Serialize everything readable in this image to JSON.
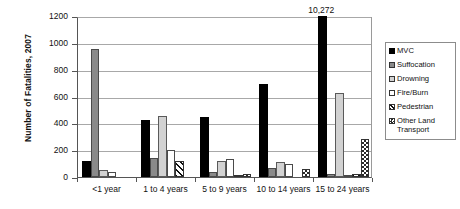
{
  "chart_data": {
    "type": "bar",
    "title": "",
    "xlabel": "",
    "ylabel": "Number of Fatalities, 2007",
    "ylim": [
      0,
      1200
    ],
    "ytick_labels": [
      "0",
      "200",
      "400",
      "600",
      "800",
      "1000",
      "1200"
    ],
    "ytick_values": [
      0,
      200,
      400,
      600,
      800,
      1000,
      1200
    ],
    "grid": true,
    "legend_position": "right",
    "categories": [
      "<1 year",
      "1 to 4 years",
      "5 to 9 years",
      "10 to 14 years",
      "15 to 24 years"
    ],
    "series": [
      {
        "name": "MVC",
        "values": [
          120,
          425,
          450,
          690,
          10272
        ]
      },
      {
        "name": "Suffocation",
        "values": [
          955,
          145,
          40,
          70,
          20
        ]
      },
      {
        "name": "Drowning",
        "values": [
          55,
          455,
          120,
          115,
          625
        ]
      },
      {
        "name": "Fire/Burn",
        "values": [
          35,
          205,
          135,
          95,
          10
        ]
      },
      {
        "name": "Pedestrian",
        "values": [
          0,
          120,
          15,
          0,
          25
        ]
      },
      {
        "name": "Other Land Transport",
        "values": [
          0,
          0,
          20,
          60,
          280
        ]
      }
    ],
    "annotations": [
      {
        "text": "10,272",
        "series": "MVC",
        "category": "15 to 24 years",
        "note": "value exceeds axis maximum; bar clipped at top"
      }
    ],
    "colors": {
      "mvc": "#000000",
      "suffocation": "#8a8a8a",
      "drowning": "#d2d2d2",
      "fire_burn": "#ffffff",
      "pedestrian": "#111111",
      "other_land_transport": "#2a2a2a",
      "gridline": "#a8a8a8",
      "axis": "#555555",
      "background": "#ffffff"
    }
  },
  "legend": {
    "items": [
      {
        "label": "MVC"
      },
      {
        "label": "Suffocation"
      },
      {
        "label": "Drowning"
      },
      {
        "label": "Fire/Burn"
      },
      {
        "label": "Pedestrian"
      },
      {
        "label": "Other Land Transport"
      }
    ]
  }
}
